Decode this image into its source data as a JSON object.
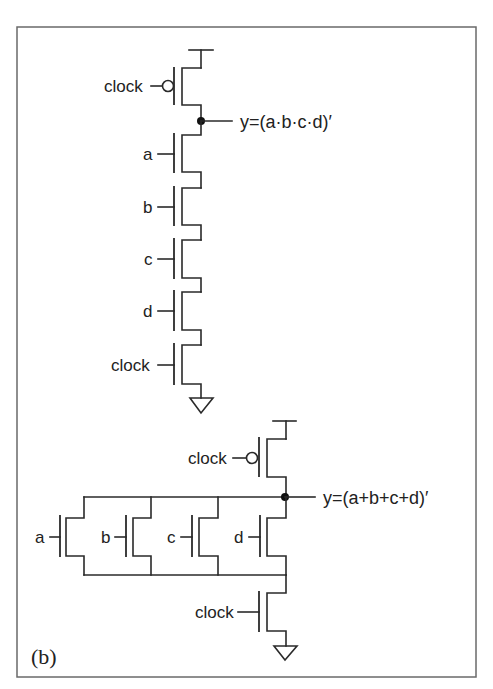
{
  "figure": {
    "panel_label": "(b)",
    "colors": {
      "stroke": "#2a2a2a",
      "frame": "#6a6a6a",
      "background": "#ffffff"
    }
  },
  "top_circuit": {
    "name": "NAND dynamic gate",
    "precharge": {
      "label": "clock",
      "type": "pmos"
    },
    "output_label": "y=(a·b·c·d)′",
    "inputs": [
      {
        "label": "a",
        "type": "nmos"
      },
      {
        "label": "b",
        "type": "nmos"
      },
      {
        "label": "c",
        "type": "nmos"
      },
      {
        "label": "d",
        "type": "nmos"
      }
    ],
    "evaluate": {
      "label": "clock",
      "type": "nmos"
    }
  },
  "bottom_circuit": {
    "name": "NOR dynamic gate",
    "precharge": {
      "label": "clock",
      "type": "pmos"
    },
    "output_label": "y=(a+b+c+d)′",
    "inputs": [
      {
        "label": "a",
        "type": "nmos"
      },
      {
        "label": "b",
        "type": "nmos"
      },
      {
        "label": "c",
        "type": "nmos"
      },
      {
        "label": "d",
        "type": "nmos"
      }
    ],
    "evaluate": {
      "label": "clock",
      "type": "nmos"
    }
  }
}
